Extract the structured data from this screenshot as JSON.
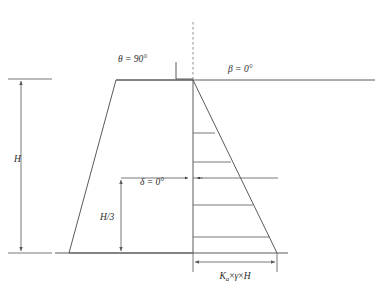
{
  "figure": {
    "background_color": "#ffffff",
    "line_color": "#5a5a5a",
    "dash_color": "#8f8f8f",
    "text_color": "#2b2b2b"
  },
  "labels": {
    "theta": {
      "symbol": "θ",
      "text": "θ = 90°",
      "value": "90",
      "unit": "°",
      "x": 118,
      "y": 62
    },
    "beta": {
      "symbol": "β",
      "text": "β = 0°",
      "value": "0",
      "unit": "°",
      "x": 228,
      "y": 72
    },
    "delta": {
      "symbol": "δ",
      "text": "δ = 0°",
      "value": "0",
      "unit": "°",
      "x": 140,
      "y": 185
    },
    "height": {
      "text": "H",
      "x": 14,
      "y": 162
    },
    "third_height": {
      "text": "H/3",
      "x": 100,
      "y": 220
    },
    "pressure": {
      "text": "Ka × γ × H",
      "base": "K",
      "subscript": "a",
      "times": "×",
      "gamma": "γ",
      "height_symbol": "H",
      "x": 235,
      "y": 279
    }
  },
  "geometry": {
    "ground_line": {
      "x1": 116,
      "y1": 80,
      "x2": 375,
      "y2": 80
    },
    "wall": {
      "top_left_x": 116,
      "top_right_x": 193,
      "top_y": 80,
      "bottom_left_x": 69,
      "bottom_right_x": 193,
      "bottom_y": 253
    },
    "base_line": {
      "x1": 55,
      "y1": 253,
      "x2": 288,
      "y2": 253
    },
    "wall_back": {
      "x": 193,
      "y1": 80,
      "y2": 253
    },
    "dashed_vertical": {
      "x": 193,
      "y1": 22,
      "y2": 80
    },
    "right_angle_marker": {
      "x1": 176,
      "y1": 62,
      "x2": 193,
      "y2": 79
    },
    "pressure_triangle": {
      "apex_x": 193,
      "apex_y": 80,
      "base_x": 277,
      "base_y": 253
    },
    "hatch_lines": [
      {
        "y": 133,
        "x2": 215
      },
      {
        "y": 162,
        "x2": 231
      },
      {
        "y": 205,
        "x2": 253
      },
      {
        "y": 237,
        "x2": 270
      }
    ],
    "resultant_line": {
      "y": 178,
      "x1": 193,
      "x2": 278
    },
    "delta_line": {
      "y": 178,
      "x1": 121,
      "x2": 193
    },
    "h3_dimension": {
      "x": 121,
      "y1": 178,
      "y2": 253
    },
    "h_dimension": {
      "x": 21,
      "y1": 79,
      "y2": 253
    },
    "h_ext_top": {
      "x1": 8,
      "y": 79,
      "x2": 52
    },
    "h_ext_bottom": {
      "x1": 8,
      "y": 253,
      "x2": 52
    },
    "bottom_dimension": {
      "y": 262,
      "x1": 193,
      "x2": 277
    },
    "bottom_tick_left": {
      "x": 193,
      "y1": 253,
      "y2": 272
    },
    "bottom_tick_right": {
      "x": 277,
      "y1": 253,
      "y2": 272
    }
  }
}
